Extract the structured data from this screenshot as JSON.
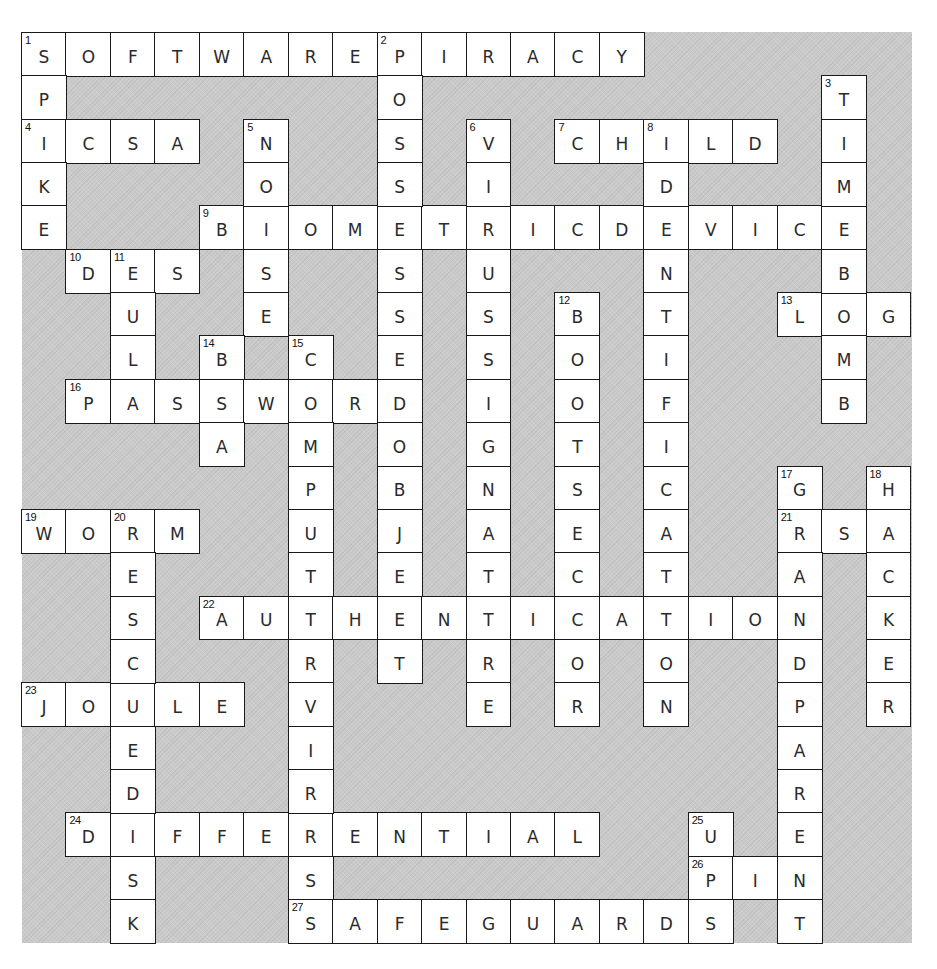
{
  "puzzle": {
    "title": "Crossword",
    "rows": 21,
    "cols": 20,
    "colors": {
      "background": "#cacaca",
      "cell": "#ffffff",
      "border": "#1a1a1a",
      "text": "#2a2a2a"
    },
    "across": [
      {
        "number": 1,
        "answer": "SOFTWAREPIRACY",
        "row": 0,
        "col": 0
      },
      {
        "number": 4,
        "answer": "ICSA",
        "row": 2,
        "col": 0
      },
      {
        "number": 7,
        "answer": "CHILD",
        "row": 2,
        "col": 12
      },
      {
        "number": 9,
        "answer": "BIOMETRICDEVICE",
        "row": 4,
        "col": 4
      },
      {
        "number": 10,
        "answer": "DES",
        "row": 5,
        "col": 1
      },
      {
        "number": 13,
        "answer": "LOG",
        "row": 6,
        "col": 17
      },
      {
        "number": 16,
        "answer": "PASSWORD",
        "row": 8,
        "col": 1
      },
      {
        "number": 19,
        "answer": "WORM",
        "row": 11,
        "col": 0
      },
      {
        "number": 21,
        "answer": "RSA",
        "row": 11,
        "col": 17
      },
      {
        "number": 22,
        "answer": "AUTHENTICATION",
        "row": 13,
        "col": 4
      },
      {
        "number": 23,
        "answer": "JOULE",
        "row": 15,
        "col": 0
      },
      {
        "number": 24,
        "answer": "DIFFERENTIAL",
        "row": 18,
        "col": 1
      },
      {
        "number": 26,
        "answer": "PIN",
        "row": 19,
        "col": 15
      },
      {
        "number": 27,
        "answer": "SAFEGUARDS",
        "row": 20,
        "col": 6
      }
    ],
    "down": [
      {
        "number": 1,
        "answer": "SPIKE",
        "row": 0,
        "col": 0
      },
      {
        "number": 2,
        "answer": "POSSESSEDOBJECT",
        "row": 0,
        "col": 8
      },
      {
        "number": 3,
        "answer": "TIMEBOMB",
        "row": 1,
        "col": 18
      },
      {
        "number": 5,
        "answer": "NOISE",
        "row": 2,
        "col": 5
      },
      {
        "number": 6,
        "answer": "VIRUSSIGNATURE",
        "row": 2,
        "col": 10
      },
      {
        "number": 8,
        "answer": "IDENTIFICATION",
        "row": 2,
        "col": 14
      },
      {
        "number": 11,
        "answer": "EULA",
        "row": 5,
        "col": 2
      },
      {
        "number": 12,
        "answer": "BOOTSECTOR",
        "row": 6,
        "col": 12
      },
      {
        "number": 14,
        "answer": "BSA",
        "row": 7,
        "col": 4
      },
      {
        "number": 15,
        "answer": "COMPUTERVIRUS",
        "row": 7,
        "col": 6
      },
      {
        "number": 17,
        "answer": "GRANDPARENT",
        "row": 10,
        "col": 17
      },
      {
        "number": 18,
        "answer": "HACKER",
        "row": 10,
        "col": 19
      },
      {
        "number": 20,
        "answer": "RESCUEDISK",
        "row": 11,
        "col": 2
      },
      {
        "number": 25,
        "answer": "UPS",
        "row": 18,
        "col": 15
      }
    ]
  }
}
